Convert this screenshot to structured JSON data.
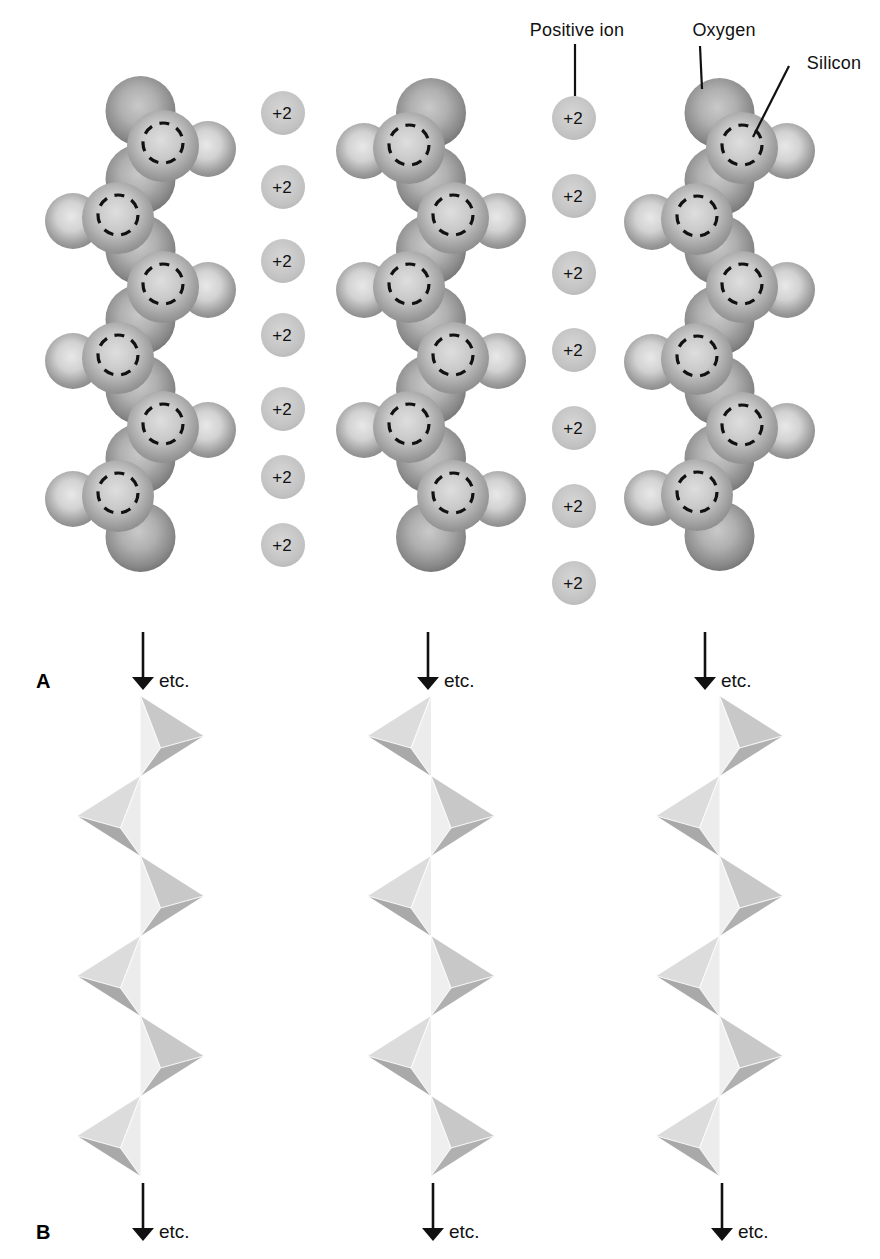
{
  "diagram": {
    "legend": {
      "positive_ion": {
        "text": "Positive ion",
        "x": 577,
        "y": 21,
        "line": [
          575,
          44,
          575,
          96
        ]
      },
      "oxygen": {
        "text": "Oxygen",
        "x": 724,
        "y": 21,
        "line": [
          700,
          46,
          702,
          89
        ]
      },
      "silicon": {
        "text": "Silicon",
        "x": 834,
        "y": 54,
        "line": [
          789,
          66,
          753,
          137
        ]
      }
    },
    "panel_a": {
      "letter": "A",
      "chains": [
        {
          "name": "left",
          "axis": 140.5,
          "pattern": "RLRLRL",
          "si_x_right": 163,
          "si_x_left": 118,
          "si_ys": [
            143,
            215,
            284,
            355,
            424,
            493
          ]
        },
        {
          "name": "middle",
          "axis": 431,
          "pattern": "LRLRLR",
          "si_x_right": 453,
          "si_x_left": 409,
          "si_ys": [
            145,
            215,
            284,
            355,
            424,
            493
          ]
        },
        {
          "name": "right",
          "axis": 719.5,
          "pattern": "RLRLRL",
          "si_x_right": 742,
          "si_x_left": 697,
          "si_ys": [
            145,
            216,
            284,
            356,
            425,
            492
          ]
        }
      ],
      "ion_columns": [
        {
          "charge": "+2",
          "x": 283,
          "ys": [
            113,
            187,
            261,
            335,
            409,
            477,
            545
          ]
        },
        {
          "charge": "+2",
          "x": 574,
          "ys": [
            118,
            196,
            273,
            350,
            428,
            506,
            583
          ]
        }
      ],
      "arrows": [
        {
          "x": 143,
          "label": "etc."
        },
        {
          "x": 428,
          "label": "etc."
        },
        {
          "x": 705,
          "label": "etc."
        }
      ],
      "arrow_top": 632,
      "arrow_tip": 690
    },
    "panel_b": {
      "letter": "B",
      "columns": [
        {
          "name": "left",
          "axis": 140.5,
          "pattern": "RLRLRL"
        },
        {
          "name": "middle",
          "axis": 431,
          "pattern": "LRLRLR"
        },
        {
          "name": "right",
          "axis": 719.5,
          "pattern": "RLRLRL"
        }
      ],
      "tet_y0": 696,
      "arrows": [
        {
          "x": 143,
          "label": "etc."
        },
        {
          "x": 433,
          "label": "etc."
        },
        {
          "x": 722,
          "label": "etc."
        }
      ],
      "arrow_top": 1183,
      "arrow_tip": 1241
    },
    "geometry": {
      "sphere_r_backbone": 35,
      "sphere_r_side": 28,
      "sphere_r_front": 36,
      "silicon_r": 20,
      "ion_r": 22,
      "side_dx": 45,
      "side_dy": 6,
      "front_dy": 3,
      "tet_height": 80,
      "tet_width": 63,
      "tet_inner_dx": 20,
      "tet_inner_dy": 52
    },
    "colors": {
      "ink": "#111111",
      "background": "#ffffff",
      "sphere_gradients": {
        "backbone": [
          "#c9c9c9",
          "#b0b0b0",
          "#8a8a8a",
          "#787878"
        ],
        "front": [
          "#dedede",
          "#c9c9c9",
          "#9e9e9e",
          "#8f8f8f"
        ],
        "side": [
          "#e8e8e8",
          "#d2d2d2",
          "#9c9c9c",
          "#8c8c8c"
        ],
        "ion": [
          "#d6d6d6",
          "#cccccc",
          "#c2c2c2",
          "#bababa"
        ]
      },
      "tet_right": {
        "top": "#c8c8c8",
        "side": "#efefef",
        "bottom": "#b0b0b0"
      },
      "tet_left": {
        "top": "#dcdcdc",
        "side": "#ececec",
        "bottom": "#a9a9a9"
      }
    }
  }
}
